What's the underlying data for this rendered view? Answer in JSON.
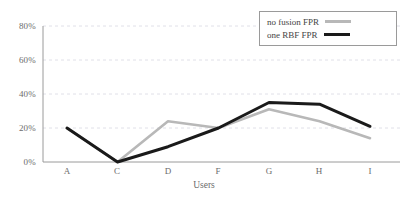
{
  "chart_data": {
    "type": "line",
    "title": "",
    "xlabel": "Users",
    "ylabel": "",
    "categories": [
      "A",
      "C",
      "D",
      "F",
      "G",
      "H",
      "I"
    ],
    "series": [
      {
        "name": "no fusion FPR",
        "color": "#b8b8b8",
        "values": [
          20,
          0,
          24,
          20,
          31,
          24,
          14
        ]
      },
      {
        "name": "one RBF FPR",
        "color": "#1a1a1a",
        "values": [
          20,
          0,
          9,
          20,
          35,
          34,
          21
        ]
      }
    ],
    "ylim": [
      0,
      80
    ],
    "yticks": [
      0,
      20,
      40,
      60,
      80
    ],
    "ytick_labels": [
      "0%",
      "20%",
      "40%",
      "60%",
      "80%"
    ],
    "grid": true,
    "grid_style": "dashed-horizontal",
    "legend_position": "top-right"
  },
  "axis": {
    "y_labels": [
      "80%",
      "60%",
      "40%",
      "20%",
      "0%"
    ],
    "x_labels": [
      "A",
      "C",
      "D",
      "F",
      "G",
      "H",
      "I"
    ],
    "x_title": "Users"
  },
  "legend": {
    "items": [
      {
        "label": "no fusion FPR"
      },
      {
        "label": "one RBF FPR"
      }
    ]
  },
  "colors": {
    "series_no_fusion": "#b8b8b8",
    "series_one_rbf": "#1a1a1a",
    "grid": "#d8d8e2",
    "axis": "#9a9a9a",
    "text": "#6b6b6b",
    "background": "#ffffff"
  }
}
